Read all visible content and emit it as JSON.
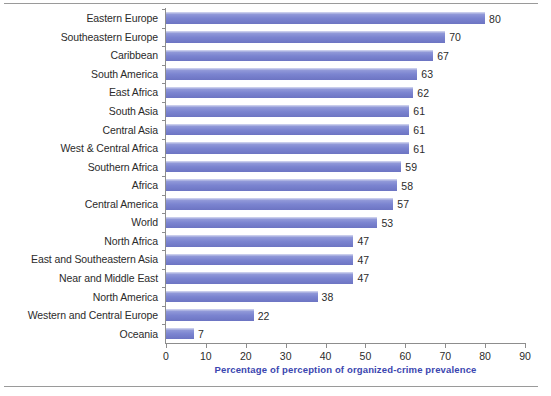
{
  "chart_data": {
    "type": "bar",
    "orientation": "horizontal",
    "title": "",
    "subtitle": "",
    "xlabel": "Percentage of perception of organized-crime prevalence",
    "ylabel": "",
    "xlim": [
      0,
      90
    ],
    "xticks": [
      0,
      10,
      20,
      30,
      40,
      50,
      60,
      70,
      80,
      90
    ],
    "grid": false,
    "legend": false,
    "bar_color": "#7b84d0",
    "xlabel_color": "#3b46b0",
    "tick_label_color": "#2b2b2b",
    "categories": [
      "Eastern Europe",
      "Southeastern Europe",
      "Caribbean",
      "South America",
      "East Africa",
      "South Asia",
      "Central Asia",
      "West & Central Africa",
      "Southern Africa",
      "Africa",
      "Central America",
      "World",
      "North Africa",
      "East and Southeastern Asia",
      "Near and Middle East",
      "North America",
      "Western and Central Europe",
      "Oceania"
    ],
    "values": [
      80,
      70,
      67,
      63,
      62,
      61,
      61,
      61,
      59,
      58,
      57,
      53,
      47,
      47,
      47,
      38,
      22,
      7
    ],
    "value_labels": [
      "80",
      "70",
      "67",
      "63",
      "62",
      "61",
      "61",
      "61",
      "59",
      "58",
      "57",
      "53",
      "47",
      "47",
      "47",
      "38",
      "22",
      "7"
    ],
    "xtick_labels": [
      "0",
      "10",
      "20",
      "30",
      "40",
      "50",
      "60",
      "70",
      "80",
      "90"
    ]
  }
}
